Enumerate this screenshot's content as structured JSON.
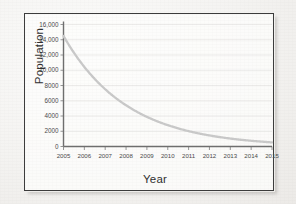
{
  "chart_data": {
    "type": "line",
    "title": "",
    "xlabel": "Year",
    "ylabel": "Population",
    "x": [
      2005,
      2006,
      2007,
      2008,
      2009,
      2010,
      2011,
      2012,
      2013,
      2014,
      2015
    ],
    "values": [
      14500,
      10400,
      7500,
      5400,
      3900,
      2800,
      2000,
      1450,
      1050,
      750,
      540
    ],
    "series": [
      {
        "name": "Population",
        "values": [
          14500,
          10400,
          7500,
          5400,
          3900,
          2800,
          2000,
          1450,
          1050,
          750,
          540
        ]
      }
    ],
    "xlim": [
      2005,
      2015
    ],
    "ylim": [
      0,
      16000
    ],
    "ytick_labels": [
      "16,000",
      "14,000",
      "12,000",
      "10,000",
      "8000",
      "6000",
      "4000",
      "2000",
      "0"
    ],
    "ytick_values": [
      16000,
      14000,
      12000,
      10000,
      8000,
      6000,
      4000,
      2000,
      0
    ],
    "xtick_labels": [
      "2005",
      "2006",
      "2007",
      "2008",
      "2009",
      "2010",
      "2011",
      "2012",
      "2013",
      "2014",
      "2015"
    ],
    "grid": true,
    "legend": "none",
    "curve_color": "#c9c9c9",
    "axis_color": "#6e6e6e",
    "decay_note": "exponential decay, ratio approx 0.72 per year"
  },
  "figure": {
    "border_color": "#3c3c3c",
    "background_color": "#f3f2f0"
  }
}
